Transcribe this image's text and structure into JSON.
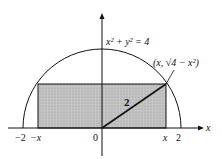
{
  "diagram": {
    "equation_label": "x² + y² = 4",
    "point_label": "(x, √4 − x²)",
    "radius_label": "2",
    "x_axis_label": "x",
    "tick_labels": {
      "neg_two": "−2",
      "neg_x": "−x",
      "origin": "0",
      "pos_x": "x",
      "pos_two": "2"
    },
    "colors": {
      "stroke": "#111111",
      "rectangle_fill": "#bdbdbd",
      "background": "#ffffff"
    }
  }
}
